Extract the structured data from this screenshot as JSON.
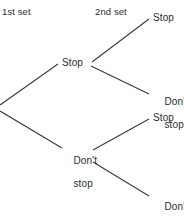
{
  "diagram": {
    "type": "probability-tree",
    "headers": {
      "first_set": "1st set",
      "second_set": "2nd set"
    },
    "root": {
      "label": ""
    },
    "level1": [
      {
        "id": "stop",
        "label": "Stop"
      },
      {
        "id": "dont-stop",
        "label_line1": "Don't",
        "label_line2": "stop"
      }
    ],
    "level2": [
      {
        "id": "stop-stop",
        "label": "Stop"
      },
      {
        "id": "stop-dontstop",
        "label_line1": "Don't",
        "label_line2": "stop"
      },
      {
        "id": "dontstop-stop",
        "label": "Stop"
      },
      {
        "id": "dontstop-dontstop",
        "label_line1": "Don't",
        "label_line2": "stop"
      }
    ],
    "colors": {
      "line": "#3a3a3a",
      "text": "#2b2b2b",
      "background": "#ffffff"
    }
  }
}
